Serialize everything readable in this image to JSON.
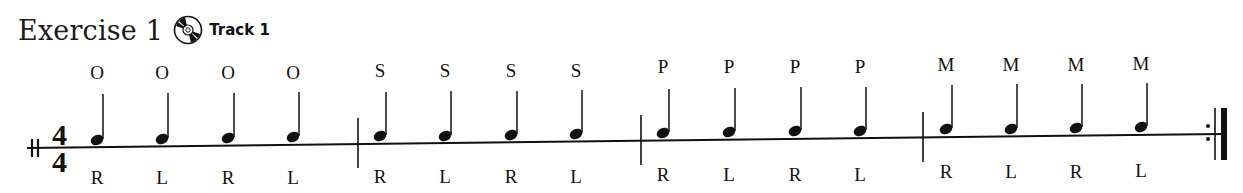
{
  "header": {
    "title": "Exercise 1",
    "cd_icon": "cd-disc-icon",
    "track_label": "Track 1"
  },
  "time_signature": {
    "top": "4",
    "bottom": "4"
  },
  "measures": [
    {
      "notes": [
        {
          "above": "O",
          "below": "R"
        },
        {
          "above": "O",
          "below": "L"
        },
        {
          "above": "O",
          "below": "R"
        },
        {
          "above": "O",
          "below": "L"
        }
      ]
    },
    {
      "notes": [
        {
          "above": "S",
          "below": "R"
        },
        {
          "above": "S",
          "below": "L"
        },
        {
          "above": "S",
          "below": "R"
        },
        {
          "above": "S",
          "below": "L"
        }
      ]
    },
    {
      "notes": [
        {
          "above": "P",
          "below": "R"
        },
        {
          "above": "P",
          "below": "L"
        },
        {
          "above": "P",
          "below": "R"
        },
        {
          "above": "P",
          "below": "L"
        }
      ]
    },
    {
      "notes": [
        {
          "above": "M",
          "below": "R"
        },
        {
          "above": "M",
          "below": "L"
        },
        {
          "above": "M",
          "below": "R"
        },
        {
          "above": "M",
          "below": "L"
        }
      ]
    }
  ],
  "end_barline": "repeat-end"
}
